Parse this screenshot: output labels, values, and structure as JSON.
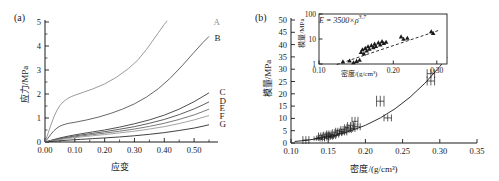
{
  "figure": {
    "panel_a_tag": "(a)",
    "panel_b_tag": "(b)"
  },
  "chart_data": [
    {
      "type": "line",
      "panel": "(a)",
      "title": "",
      "xlabel": "应变",
      "ylabel": "应力/MPa",
      "xlim": [
        0.0,
        0.56
      ],
      "ylim": [
        0,
        5
      ],
      "xticks": [
        0.0,
        0.1,
        0.2,
        0.3,
        0.4,
        0.5
      ],
      "xtick_labels": [
        "0.00",
        "0.10",
        "0.20",
        "0.30",
        "0.40",
        "0.50"
      ],
      "yticks": [
        0,
        1,
        2,
        3,
        4,
        5
      ],
      "ytick_labels": [
        "0",
        "1",
        "2",
        "3",
        "4",
        "5"
      ],
      "grid": false,
      "legend_position": "right-inline-labels",
      "series": [
        {
          "name": "A",
          "color": "#8f8f8f",
          "label_x": 0.545,
          "label_y": 5.0,
          "x": [
            0.0,
            0.01,
            0.02,
            0.03,
            0.04,
            0.05,
            0.06,
            0.07,
            0.08,
            0.09,
            0.1,
            0.13,
            0.16,
            0.2,
            0.24,
            0.28,
            0.31,
            0.34,
            0.36,
            0.38,
            0.4,
            0.41
          ],
          "y": [
            0.0,
            0.35,
            0.72,
            1.05,
            1.32,
            1.52,
            1.66,
            1.76,
            1.84,
            1.9,
            1.95,
            2.08,
            2.21,
            2.42,
            2.7,
            3.06,
            3.4,
            3.85,
            4.2,
            4.55,
            4.9,
            5.05
          ]
        },
        {
          "name": "B",
          "color": "#555555",
          "label_x": 0.548,
          "label_y": 4.35,
          "x": [
            0.0,
            0.01,
            0.02,
            0.03,
            0.04,
            0.05,
            0.06,
            0.07,
            0.08,
            0.09,
            0.1,
            0.14,
            0.18,
            0.22,
            0.26,
            0.3,
            0.34,
            0.38,
            0.42,
            0.46,
            0.5,
            0.53,
            0.55
          ],
          "y": [
            0.0,
            0.16,
            0.33,
            0.47,
            0.58,
            0.66,
            0.71,
            0.75,
            0.78,
            0.8,
            0.82,
            0.92,
            1.04,
            1.19,
            1.37,
            1.59,
            1.87,
            2.22,
            2.66,
            3.18,
            3.74,
            4.15,
            4.4
          ]
        },
        {
          "name": "C",
          "color": "#3a3a3a",
          "label_x": 0.565,
          "label_y": 2.08,
          "x": [
            0.0,
            0.02,
            0.05,
            0.08,
            0.12,
            0.16,
            0.2,
            0.25,
            0.3,
            0.35,
            0.4,
            0.45,
            0.5,
            0.53,
            0.55
          ],
          "y": [
            0.0,
            0.07,
            0.17,
            0.25,
            0.34,
            0.42,
            0.5,
            0.62,
            0.76,
            0.92,
            1.12,
            1.37,
            1.68,
            1.9,
            2.05
          ]
        },
        {
          "name": "D",
          "color": "#4d4d4d",
          "label_x": 0.565,
          "label_y": 1.7,
          "x": [
            0.0,
            0.02,
            0.05,
            0.08,
            0.12,
            0.16,
            0.2,
            0.25,
            0.3,
            0.35,
            0.4,
            0.45,
            0.5,
            0.53,
            0.55
          ],
          "y": [
            0.0,
            0.06,
            0.14,
            0.21,
            0.29,
            0.36,
            0.43,
            0.53,
            0.64,
            0.78,
            0.94,
            1.14,
            1.38,
            1.55,
            1.67
          ]
        },
        {
          "name": "E",
          "color": "#6b6b6b",
          "label_x": 0.565,
          "label_y": 1.4,
          "x": [
            0.0,
            0.02,
            0.05,
            0.08,
            0.12,
            0.16,
            0.2,
            0.25,
            0.3,
            0.35,
            0.4,
            0.45,
            0.5,
            0.53,
            0.55
          ],
          "y": [
            0.0,
            0.05,
            0.12,
            0.18,
            0.25,
            0.31,
            0.37,
            0.45,
            0.54,
            0.65,
            0.78,
            0.94,
            1.13,
            1.27,
            1.37
          ]
        },
        {
          "name": "F",
          "color": "#9a9a9a",
          "label_x": 0.565,
          "label_y": 1.1,
          "x": [
            0.0,
            0.02,
            0.05,
            0.08,
            0.12,
            0.16,
            0.2,
            0.25,
            0.3,
            0.35,
            0.4,
            0.45,
            0.5,
            0.53,
            0.55
          ],
          "y": [
            0.0,
            0.04,
            0.1,
            0.15,
            0.21,
            0.26,
            0.31,
            0.38,
            0.45,
            0.54,
            0.64,
            0.77,
            0.92,
            1.03,
            1.1
          ]
        },
        {
          "name": "G",
          "color": "#2b2b2b",
          "label_x": 0.565,
          "label_y": 0.74,
          "x": [
            0.0,
            0.02,
            0.05,
            0.08,
            0.12,
            0.16,
            0.2,
            0.25,
            0.3,
            0.35,
            0.4,
            0.45,
            0.5,
            0.53,
            0.55
          ],
          "y": [
            0.0,
            0.02,
            0.05,
            0.08,
            0.11,
            0.14,
            0.17,
            0.21,
            0.26,
            0.32,
            0.39,
            0.48,
            0.58,
            0.66,
            0.72
          ]
        }
      ]
    },
    {
      "type": "scatter",
      "panel": "(b)",
      "title": "",
      "xlabel": "密度/(g/cm³)",
      "ylabel": "模量/MPa",
      "xlim": [
        0.1,
        0.35
      ],
      "ylim": [
        0,
        50
      ],
      "xticks": [
        0.1,
        0.15,
        0.2,
        0.25,
        0.3,
        0.35
      ],
      "xtick_labels": [
        "0.10",
        "0.15",
        "0.20",
        "0.25",
        "0.30",
        "0.35"
      ],
      "yticks": [
        0,
        5,
        10,
        15,
        20,
        25,
        30,
        35,
        40,
        45,
        50
      ],
      "ytick_labels": [
        "0",
        "5",
        "10",
        "15",
        "20",
        "25",
        "30",
        "35",
        "40",
        "45",
        "50"
      ],
      "grid": false,
      "marker": "cross-with-errorbars",
      "points": [
        {
          "x": 0.12,
          "y": 1.2,
          "xerr": 0.004,
          "yerr": 1.6
        },
        {
          "x": 0.134,
          "y": 1.8,
          "xerr": 0.003,
          "yerr": 0.9
        },
        {
          "x": 0.138,
          "y": 2.2,
          "xerr": 0.003,
          "yerr": 1.0
        },
        {
          "x": 0.14,
          "y": 3.2,
          "xerr": 0.003,
          "yerr": 1.1
        },
        {
          "x": 0.142,
          "y": 1.5,
          "xerr": 0.003,
          "yerr": 0.8
        },
        {
          "x": 0.145,
          "y": 2.6,
          "xerr": 0.003,
          "yerr": 0.9
        },
        {
          "x": 0.147,
          "y": 3.6,
          "xerr": 0.003,
          "yerr": 1.0
        },
        {
          "x": 0.148,
          "y": 1.9,
          "xerr": 0.003,
          "yerr": 0.8
        },
        {
          "x": 0.15,
          "y": 2.9,
          "xerr": 0.003,
          "yerr": 0.9
        },
        {
          "x": 0.151,
          "y": 4.0,
          "xerr": 0.003,
          "yerr": 1.1
        },
        {
          "x": 0.153,
          "y": 2.2,
          "xerr": 0.003,
          "yerr": 0.8
        },
        {
          "x": 0.155,
          "y": 3.4,
          "xerr": 0.003,
          "yerr": 1.0
        },
        {
          "x": 0.157,
          "y": 2.5,
          "xerr": 0.003,
          "yerr": 0.9
        },
        {
          "x": 0.159,
          "y": 4.4,
          "xerr": 0.003,
          "yerr": 1.2
        },
        {
          "x": 0.161,
          "y": 3.1,
          "xerr": 0.003,
          "yerr": 0.9
        },
        {
          "x": 0.163,
          "y": 5.0,
          "xerr": 0.003,
          "yerr": 1.2
        },
        {
          "x": 0.165,
          "y": 3.8,
          "xerr": 0.003,
          "yerr": 1.0
        },
        {
          "x": 0.168,
          "y": 4.6,
          "xerr": 0.003,
          "yerr": 1.1
        },
        {
          "x": 0.17,
          "y": 5.6,
          "xerr": 0.003,
          "yerr": 1.3
        },
        {
          "x": 0.172,
          "y": 4.1,
          "xerr": 0.003,
          "yerr": 1.0
        },
        {
          "x": 0.175,
          "y": 6.2,
          "xerr": 0.003,
          "yerr": 1.4
        },
        {
          "x": 0.178,
          "y": 5.2,
          "xerr": 0.003,
          "yerr": 1.2
        },
        {
          "x": 0.18,
          "y": 7.0,
          "xerr": 0.004,
          "yerr": 1.5
        },
        {
          "x": 0.183,
          "y": 5.8,
          "xerr": 0.003,
          "yerr": 1.3
        },
        {
          "x": 0.186,
          "y": 8.8,
          "xerr": 0.004,
          "yerr": 1.8
        },
        {
          "x": 0.189,
          "y": 6.6,
          "xerr": 0.004,
          "yerr": 1.4
        },
        {
          "x": 0.22,
          "y": 17.0,
          "xerr": 0.005,
          "yerr": 2.2
        },
        {
          "x": 0.23,
          "y": 10.2,
          "xerr": 0.005,
          "yerr": 1.4
        },
        {
          "x": 0.288,
          "y": 28.2,
          "xerr": 0.005,
          "yerr": 1.8
        },
        {
          "x": 0.288,
          "y": 25.2,
          "xerr": 0.005,
          "yerr": 1.8
        }
      ],
      "fit_curve": {
        "equation": "E = 3500×ρ^3.7",
        "coefficient": 3500,
        "exponent": 3.7,
        "x": [
          0.105,
          0.12,
          0.14,
          0.16,
          0.18,
          0.2,
          0.22,
          0.24,
          0.26,
          0.28,
          0.3,
          0.31
        ],
        "y": [
          0.62,
          1.08,
          1.93,
          3.17,
          4.9,
          7.19,
          10.17,
          13.95,
          18.63,
          24.31,
          31.1,
          34.9
        ]
      },
      "inset": {
        "type": "scatter",
        "xlabel": "密度/(g/cm³)",
        "ylabel": "模量/MPa",
        "xscale": "log",
        "yscale": "log",
        "xlim": [
          0.1,
          0.33
        ],
        "ylim": [
          1,
          100
        ],
        "xticks": [
          0.1,
          0.2,
          0.3
        ],
        "xtick_labels": [
          "0.10",
          "0.20",
          "0.30"
        ],
        "yticks": [
          1,
          10,
          100
        ],
        "ytick_labels": [
          "1",
          "10",
          "100"
        ],
        "annotation": "E = 3500×ρ3.7",
        "annotation_base": "E = 3500×ρ",
        "annotation_exp": "3.7",
        "marker": "triangle",
        "points": [
          {
            "x": 0.125,
            "y": 1.25
          },
          {
            "x": 0.133,
            "y": 1.35
          },
          {
            "x": 0.138,
            "y": 1.15
          },
          {
            "x": 0.142,
            "y": 1.3
          },
          {
            "x": 0.146,
            "y": 1.45
          },
          {
            "x": 0.148,
            "y": 3.0
          },
          {
            "x": 0.15,
            "y": 3.8
          },
          {
            "x": 0.152,
            "y": 2.6
          },
          {
            "x": 0.154,
            "y": 4.3
          },
          {
            "x": 0.156,
            "y": 3.4
          },
          {
            "x": 0.158,
            "y": 5.0
          },
          {
            "x": 0.16,
            "y": 4.0
          },
          {
            "x": 0.163,
            "y": 5.6
          },
          {
            "x": 0.166,
            "y": 4.6
          },
          {
            "x": 0.168,
            "y": 6.4
          },
          {
            "x": 0.17,
            "y": 5.2
          },
          {
            "x": 0.174,
            "y": 7.2
          },
          {
            "x": 0.177,
            "y": 6.0
          },
          {
            "x": 0.18,
            "y": 8.0
          },
          {
            "x": 0.183,
            "y": 6.8
          },
          {
            "x": 0.187,
            "y": 7.6
          },
          {
            "x": 0.215,
            "y": 12.5
          },
          {
            "x": 0.22,
            "y": 10.0
          },
          {
            "x": 0.228,
            "y": 11.0
          },
          {
            "x": 0.285,
            "y": 20.0
          },
          {
            "x": 0.29,
            "y": 17.0
          }
        ],
        "fit_line": {
          "x": [
            0.118,
            0.305
          ],
          "y": [
            0.95,
            22.0
          ]
        }
      }
    }
  ]
}
